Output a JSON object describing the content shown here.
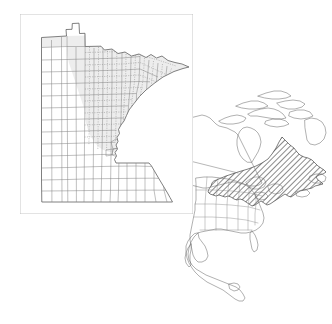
{
  "figure": {
    "background_color": "#ffffff",
    "width": 332,
    "height": 324
  },
  "inset_panel": {
    "name": "Minnesota county map",
    "frame": {
      "x": 20,
      "y": 14,
      "width": 173,
      "height": 200
    },
    "frame_stroke_color": "#b9b9b9",
    "frame_stroke_width": 0.8,
    "state_outline_color": "#555555",
    "county_line_color": "#808080",
    "county_dotted_line_color": "#8a8a8a",
    "shaded_region_label": "Northern forested counties",
    "shaded_fill_color": "#ededed",
    "unshaded_fill_color": "#ffffff"
  },
  "locator_panel": {
    "name": "North America locator map",
    "coastline_color": "#6f6f6f",
    "border_color": "#7a7a7a",
    "state_border_color": "#8c8c8c",
    "hatch_region_label": "Eastern North American boreal / Great Lakes forest region",
    "hatch_line_color": "#2b2b2b",
    "hatch_fill_color": "#ffffff",
    "hatch_angle_degrees": 45
  },
  "colors": {
    "ink": "#3a3a3a",
    "paper": "#ffffff",
    "shade": "#ededed",
    "hatch": "#2b2b2b",
    "frame": "#b9b9b9"
  }
}
